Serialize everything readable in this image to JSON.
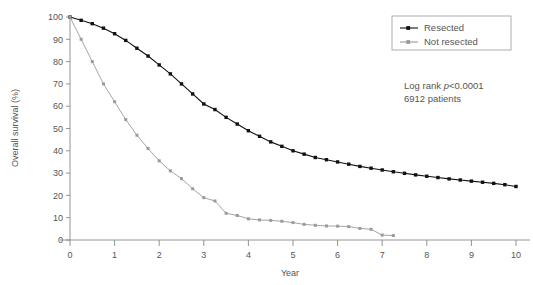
{
  "chart_data": {
    "type": "line",
    "title": "",
    "xlabel": "Year",
    "ylabel": "Overall survival (%)",
    "xlim": [
      0,
      10
    ],
    "ylim": [
      0,
      100
    ],
    "xticks": [
      "0",
      "1",
      "2",
      "3",
      "4",
      "5",
      "6",
      "7",
      "8",
      "9",
      "10"
    ],
    "yticks": [
      "0",
      "10",
      "20",
      "30",
      "40",
      "50",
      "60",
      "70",
      "80",
      "90",
      "100"
    ],
    "grid": false,
    "legend_position": "top-right",
    "annotations": [
      {
        "text_plain": "Log rank ",
        "text_italic": "p",
        "text_tail": "<0.0001"
      },
      {
        "text_plain": "6912 patients"
      }
    ],
    "annotation_line1_plain": "Log rank ",
    "annotation_line1_italic": "p",
    "annotation_line1_tail": "<0.0001",
    "annotation_line2": "6912 patients",
    "series": [
      {
        "name": "Resected",
        "color": "#111111",
        "marker": "square",
        "x": [
          0,
          0.25,
          0.5,
          0.75,
          1.0,
          1.25,
          1.5,
          1.75,
          2.0,
          2.25,
          2.5,
          2.75,
          3.0,
          3.25,
          3.5,
          3.75,
          4.0,
          4.25,
          4.5,
          4.75,
          5.0,
          5.25,
          5.5,
          5.75,
          6.0,
          6.25,
          6.5,
          6.75,
          7.0,
          7.25,
          7.5,
          7.75,
          8.0,
          8.25,
          8.5,
          8.75,
          9.0,
          9.25,
          9.5,
          9.75,
          10.0
        ],
        "y": [
          100,
          98.5,
          97,
          95,
          92.5,
          89.5,
          86,
          82.5,
          78.5,
          74.5,
          70,
          65.5,
          61,
          58.5,
          55,
          52,
          49,
          46.5,
          44,
          42,
          40,
          38.5,
          37,
          36,
          35,
          34,
          33,
          32.2,
          31.4,
          30.6,
          29.9,
          29.2,
          28.6,
          28.0,
          27.4,
          26.9,
          26.4,
          25.9,
          25.4,
          24.8,
          24.0
        ]
      },
      {
        "name": "Not resected",
        "color": "#9a9a9a",
        "marker": "square",
        "x": [
          0,
          0.25,
          0.5,
          0.75,
          1.0,
          1.25,
          1.5,
          1.75,
          2.0,
          2.25,
          2.5,
          2.75,
          3.0,
          3.25,
          3.5,
          3.75,
          4.0,
          4.25,
          4.5,
          4.75,
          5.0,
          5.25,
          5.5,
          5.75,
          6.0,
          6.25,
          6.5,
          6.75,
          7.0,
          7.25
        ],
        "y": [
          100,
          90,
          80,
          70,
          62,
          54,
          47,
          41,
          35.5,
          31,
          27.5,
          23,
          19,
          17.5,
          12,
          11,
          9.5,
          9,
          8.8,
          8.4,
          7.8,
          7.0,
          6.6,
          6.3,
          6.2,
          6.0,
          5.2,
          4.8,
          2.2,
          2.0
        ]
      }
    ],
    "legend": [
      {
        "label": "Resected",
        "color": "#111111"
      },
      {
        "label": "Not resected",
        "color": "#9a9a9a"
      }
    ]
  },
  "axes": {
    "x_title": "Year",
    "y_title": "Overall survival (%)"
  }
}
